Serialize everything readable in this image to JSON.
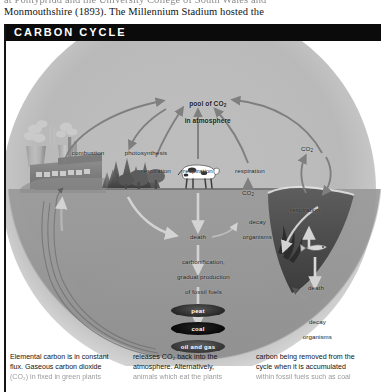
{
  "page_top_text": {
    "lines": [
      "at Pontypridd and the University College of South Wales and",
      "Monmouthshire (1893). The Millennium Stadium hosted the"
    ]
  },
  "figure": {
    "title": "CARBON CYCLE",
    "diagram": {
      "type": "cycle-diagram",
      "pool_label_line1": "pool of CO",
      "pool_label_sub": "2",
      "pool_label_line2": "in atmosphere",
      "labels": {
        "combustion": "combustion",
        "photosynthesis": "photosynthesis",
        "respiration_land_plants": "respiration",
        "respiration_soil": "respiration",
        "respiration_animals": "respiration",
        "respiration_ocean": "respiration",
        "co2_land": "CO",
        "co2_land_sub": "2",
        "co2_ocean": "CO",
        "co2_ocean_sub": "2",
        "death_land": "death",
        "death_ocean": "death",
        "decay_organisms_land_l1": "decay",
        "decay_organisms_land_l2": "organisms",
        "decay_organisms_ocean_l1": "decay",
        "decay_organisms_ocean_l2": "organisms",
        "carbonification_l1": "carbonification,",
        "carbonification_l2": "gradual production",
        "carbonification_l3": "of fossil fuels"
      },
      "fossil_fuels": [
        "peat",
        "coal",
        "oil and gas"
      ],
      "scene_elements": [
        "factory-with-smokestacks",
        "conifer-trees",
        "broadleaf-trees",
        "cow",
        "ocean",
        "fish",
        "seaweed"
      ]
    }
  },
  "caption": {
    "columns": [
      {
        "lines": [
          "Elemental carbon is in constant",
          "flux. Gaseous carbon dioxide",
          "(CO₂) in fixed in green plants"
        ]
      },
      {
        "lines": [
          "releases CO₂ back into the",
          "atmosphere. Alternatively,",
          "animals which eat the plants"
        ]
      },
      {
        "lines": [
          "carbon being removed from the",
          "cycle when it is accumulated",
          "within fossil fuels such as coal"
        ]
      }
    ]
  },
  "colors": {
    "header_bg": "#0b0b0b",
    "header_text": "#ffffff",
    "globe": "#bdbdbd",
    "ground": "#949494",
    "arrow": "#808080",
    "text": "#1a1a1a"
  }
}
